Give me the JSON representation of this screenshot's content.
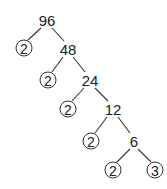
{
  "diagram": {
    "type": "factor-tree",
    "root": "96",
    "composites": [
      "96",
      "48",
      "24",
      "12",
      "6"
    ],
    "prime_factors": [
      "2",
      "2",
      "2",
      "2",
      "2",
      "3"
    ],
    "nodes": [
      {
        "id": "n96",
        "label": "96",
        "circled": false,
        "x": 47,
        "y": 20
      },
      {
        "id": "p1",
        "label": "2",
        "circled": true,
        "x": 24,
        "y": 48
      },
      {
        "id": "n48",
        "label": "48",
        "circled": false,
        "x": 68,
        "y": 49
      },
      {
        "id": "p2",
        "label": "2",
        "circled": true,
        "x": 48,
        "y": 80
      },
      {
        "id": "n24",
        "label": "24",
        "circled": false,
        "x": 90,
        "y": 80
      },
      {
        "id": "p3",
        "label": "2",
        "circled": true,
        "x": 68,
        "y": 109
      },
      {
        "id": "n12",
        "label": "12",
        "circled": false,
        "x": 113,
        "y": 109
      },
      {
        "id": "p4",
        "label": "2",
        "circled": true,
        "x": 91,
        "y": 141
      },
      {
        "id": "n6",
        "label": "6",
        "circled": false,
        "x": 134,
        "y": 141
      },
      {
        "id": "p5",
        "label": "2",
        "circled": true,
        "x": 113,
        "y": 170
      },
      {
        "id": "p6",
        "label": "3",
        "circled": true,
        "x": 155,
        "y": 170
      }
    ],
    "edges": [
      [
        "n96",
        "p1"
      ],
      [
        "n96",
        "n48"
      ],
      [
        "n48",
        "p2"
      ],
      [
        "n48",
        "n24"
      ],
      [
        "n24",
        "p3"
      ],
      [
        "n24",
        "n12"
      ],
      [
        "n12",
        "p4"
      ],
      [
        "n12",
        "n6"
      ],
      [
        "n6",
        "p5"
      ],
      [
        "n6",
        "p6"
      ]
    ]
  }
}
